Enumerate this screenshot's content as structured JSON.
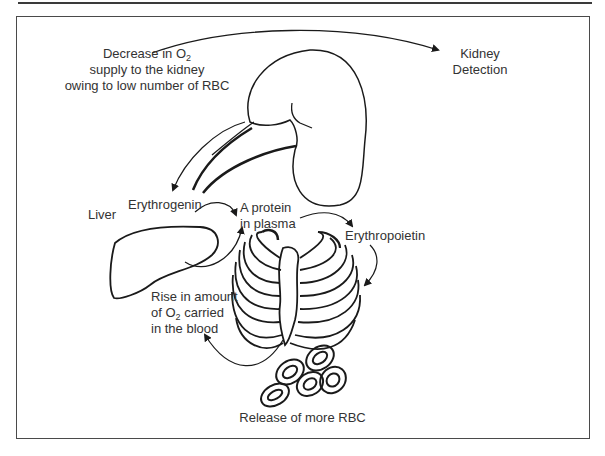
{
  "diagram": {
    "type": "biological-feedback-loop",
    "nodes": {
      "decrease_o2": {
        "line1_prefix": "Decrease in O",
        "line1_sub": "2",
        "line2": "supply to the kidney",
        "line3": "owing to low number of RBC"
      },
      "kidney_detection": {
        "line1": "Kidney",
        "line2": "Detection"
      },
      "liver": {
        "label": "Liver"
      },
      "erythrogenin": {
        "label": "Erythrogenin"
      },
      "protein_in_plasma": {
        "line1": "A protein",
        "line2": "in plasma"
      },
      "erythropoietin": {
        "label": "Erythropoietin"
      },
      "rise_o2": {
        "line1": "Rise in amount",
        "line2_prefix": "of O",
        "line2_sub": "2",
        "line2_suffix": " carried",
        "line3": "in the blood"
      },
      "release_rbc": {
        "label": "Release of more RBC"
      }
    },
    "edges": [
      {
        "from": "Decrease in O2 supply",
        "to": "Kidney Detection"
      },
      {
        "from": "Kidney",
        "to": "Erythrogenin"
      },
      {
        "from": "Erythrogenin",
        "to": "A protein in plasma"
      },
      {
        "from": "Liver",
        "to": "A protein in plasma"
      },
      {
        "from": "A protein in plasma",
        "to": "Erythropoietin"
      },
      {
        "from": "Erythropoietin",
        "to": "Bone marrow (rib cage)"
      },
      {
        "from": "Release of more RBC",
        "to": "Rise in amount of O2 carried in the blood"
      }
    ],
    "images": [
      "kidney",
      "liver",
      "rib-cage-bone-marrow",
      "red-blood-cells"
    ]
  },
  "colors": {
    "line": "#1a1a1a",
    "text": "#333333",
    "frame": "#4a4a4a"
  }
}
